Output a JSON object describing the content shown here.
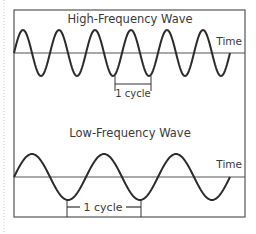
{
  "diagram": {
    "top_panel": {
      "title": "High-Frequency Wave",
      "axis_label": "Time",
      "cycle_label": "1 cycle",
      "period_px": 36,
      "amplitude_px": 23,
      "cycles_shown": 6
    },
    "bottom_panel": {
      "title": "Low-Frequency Wave",
      "axis_label": "Time",
      "cycle_label": "1 cycle",
      "period_px": 72,
      "amplitude_px": 23,
      "cycles_shown": 3
    },
    "colors": {
      "stroke": "#2b2b2b",
      "axis": "#555555",
      "border": "#555555",
      "dotted_margin": "#c8c8c8"
    }
  }
}
